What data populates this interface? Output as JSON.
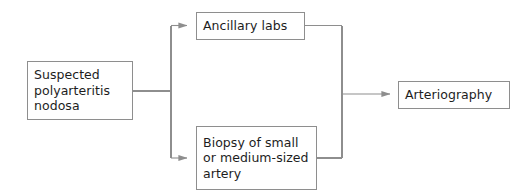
{
  "diagram": {
    "colors": {
      "box_border": "#8e8e8e",
      "connector": "#8e8e8e",
      "text": "#1d1d1d",
      "background": "#ffffff"
    },
    "nodes": [
      {
        "id": "suspected",
        "label": "Suspected\npolyarteritis\nnodosa",
        "lines": [
          "Suspected",
          "polyarteritis",
          "nodosa"
        ]
      },
      {
        "id": "ancillary",
        "label": "Ancillary labs",
        "lines": [
          "Ancillary labs"
        ]
      },
      {
        "id": "biopsy",
        "label": "Biopsy of small\nor medium-sized\nartery",
        "lines": [
          "Biopsy of small",
          "or medium-sized",
          "artery"
        ]
      },
      {
        "id": "arteriography",
        "label": "Arteriography",
        "lines": [
          "Arteriography"
        ]
      }
    ],
    "edges": [
      {
        "from": "suspected",
        "to": "ancillary",
        "arrow": true
      },
      {
        "from": "suspected",
        "to": "biopsy",
        "arrow": true
      },
      {
        "from": "ancillary",
        "to": "arteriography",
        "arrow": true
      },
      {
        "from": "biopsy",
        "to": "arteriography",
        "arrow": true
      }
    ]
  }
}
